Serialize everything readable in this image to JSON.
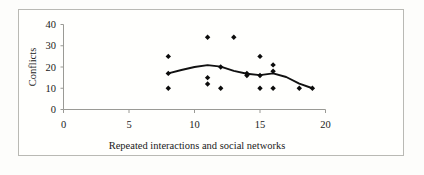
{
  "chart_data": {
    "type": "scatter",
    "title": "",
    "xlabel": "Repeated interactions and social networks",
    "ylabel": "Conflicts",
    "xlim": [
      0,
      20
    ],
    "ylim": [
      0,
      40
    ],
    "xticks": [
      0,
      5,
      10,
      15,
      20
    ],
    "yticks": [
      0,
      10,
      20,
      30,
      40
    ],
    "xtick_labels": [
      "0",
      "5",
      "10",
      "15",
      "20"
    ],
    "ytick_labels": [
      "0",
      "10",
      "20",
      "30",
      "40"
    ],
    "grid": false,
    "legend": false,
    "marker": "diamond",
    "marker_color": "#0c0c0c",
    "line_color": "#111111",
    "points": [
      {
        "x": 8,
        "y": 25
      },
      {
        "x": 8,
        "y": 17
      },
      {
        "x": 8,
        "y": 10
      },
      {
        "x": 11,
        "y": 34
      },
      {
        "x": 11,
        "y": 15
      },
      {
        "x": 11,
        "y": 12
      },
      {
        "x": 12,
        "y": 20
      },
      {
        "x": 12,
        "y": 10
      },
      {
        "x": 13,
        "y": 34
      },
      {
        "x": 14,
        "y": 17
      },
      {
        "x": 14,
        "y": 16
      },
      {
        "x": 15,
        "y": 25
      },
      {
        "x": 15,
        "y": 16
      },
      {
        "x": 15,
        "y": 10
      },
      {
        "x": 16,
        "y": 21
      },
      {
        "x": 16,
        "y": 18
      },
      {
        "x": 16,
        "y": 10
      },
      {
        "x": 18,
        "y": 10
      },
      {
        "x": 19,
        "y": 10
      }
    ],
    "trend_line": [
      {
        "x": 8,
        "y": 17
      },
      {
        "x": 9,
        "y": 18.6
      },
      {
        "x": 10,
        "y": 20
      },
      {
        "x": 11,
        "y": 20.9
      },
      {
        "x": 12,
        "y": 20.2
      },
      {
        "x": 13,
        "y": 18.2
      },
      {
        "x": 14,
        "y": 16.8
      },
      {
        "x": 15,
        "y": 16.2
      },
      {
        "x": 16,
        "y": 17
      },
      {
        "x": 17,
        "y": 15.3
      },
      {
        "x": 18,
        "y": 12.2
      },
      {
        "x": 19,
        "y": 10
      }
    ]
  },
  "axes": {
    "y_title": "Conflicts",
    "x_title": "Repeated interactions and social networks",
    "x_labels": [
      "0",
      "5",
      "10",
      "15",
      "20"
    ],
    "y_labels": [
      "0",
      "10",
      "20",
      "30",
      "40"
    ]
  }
}
